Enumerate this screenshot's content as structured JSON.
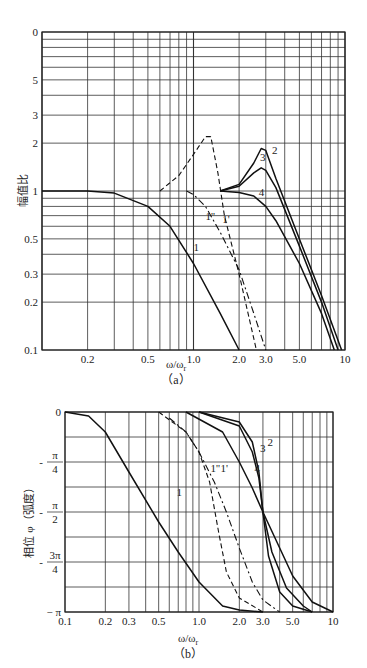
{
  "chart_data": [
    {
      "id": "a",
      "type": "line",
      "caption": "(a)",
      "title": "",
      "xlabel": "ω/ω_r",
      "ylabel": "幅值比",
      "xscale": "log",
      "yscale": "log",
      "xlim": [
        0.1,
        10
      ],
      "ylim": [
        0.1,
        10
      ],
      "x_ticks": [
        "0.2",
        "0.5",
        "1.0",
        "2.0",
        "3.0",
        "5.0",
        "10"
      ],
      "y_ticks": [
        "0",
        "5",
        "3",
        "2",
        "1",
        "0.5",
        "0.3",
        "0.2",
        "0.1"
      ],
      "grid": true,
      "series": [
        {
          "name": "1",
          "style": "solid",
          "x": [
            0.1,
            0.2,
            0.3,
            0.5,
            0.7,
            1.0,
            1.5,
            2.0
          ],
          "y": [
            1.0,
            1.0,
            0.97,
            0.8,
            0.6,
            0.35,
            0.17,
            0.1
          ]
        },
        {
          "name": "1'",
          "style": "dashed",
          "x": [
            0.6,
            0.8,
            1.0,
            1.2,
            1.3,
            1.45,
            1.6,
            2.0,
            2.6
          ],
          "y": [
            1.0,
            1.25,
            1.7,
            2.2,
            2.2,
            1.3,
            0.7,
            0.3,
            0.1
          ]
        },
        {
          "name": "1''",
          "style": "dash-dot",
          "x": [
            0.9,
            1.0,
            1.2,
            1.5,
            2.0,
            2.5,
            3.0
          ],
          "y": [
            1.0,
            0.95,
            0.8,
            0.55,
            0.32,
            0.17,
            0.1
          ]
        },
        {
          "name": "2",
          "style": "solid",
          "x": [
            1.5,
            2.0,
            2.5,
            2.8,
            3.0,
            3.5,
            5.0,
            7.0,
            9.5
          ],
          "y": [
            1.0,
            1.1,
            1.5,
            1.85,
            1.8,
            1.2,
            0.5,
            0.22,
            0.1
          ]
        },
        {
          "name": "3",
          "style": "solid",
          "x": [
            1.5,
            2.0,
            2.5,
            2.8,
            3.0,
            3.5,
            5.0,
            7.0,
            9.0
          ],
          "y": [
            1.0,
            1.07,
            1.3,
            1.4,
            1.35,
            1.05,
            0.45,
            0.2,
            0.1
          ]
        },
        {
          "name": "4",
          "style": "solid",
          "x": [
            1.5,
            2.0,
            2.5,
            3.0,
            3.5,
            5.0,
            7.0,
            8.5
          ],
          "y": [
            1.0,
            0.98,
            0.93,
            0.8,
            0.65,
            0.35,
            0.17,
            0.1
          ]
        }
      ]
    },
    {
      "id": "b",
      "type": "line",
      "caption": "(b)",
      "title": "",
      "xlabel": "ω/ω_r",
      "ylabel": "相位 φ (弧度)",
      "xscale": "log",
      "yscale": "linear",
      "xlim": [
        0.1,
        10
      ],
      "ylim": [
        -3.1416,
        0
      ],
      "x_ticks": [
        "0.1",
        "0.2",
        "0.3",
        "0.5",
        "1.0",
        "2.0",
        "3.0",
        "5.0",
        "10"
      ],
      "y_ticks": [
        "0",
        "-π/4",
        "-π/2",
        "-3π/4",
        "-π"
      ],
      "grid": true,
      "series": [
        {
          "name": "1",
          "style": "solid",
          "x": [
            0.1,
            0.15,
            0.2,
            0.3,
            0.5,
            0.7,
            1.0,
            1.5,
            2.0,
            3.0
          ],
          "y_frac_pi": [
            0,
            -0.02,
            -0.1,
            -0.3,
            -0.55,
            -0.7,
            -0.85,
            -0.97,
            -0.99,
            -1.0
          ]
        },
        {
          "name": "1'",
          "style": "dashed",
          "x": [
            0.5,
            0.8,
            1.0,
            1.2,
            1.4,
            1.6,
            2.0,
            3.0
          ],
          "y_frac_pi": [
            0,
            -0.1,
            -0.2,
            -0.35,
            -0.6,
            -0.8,
            -0.93,
            -1.0
          ]
        },
        {
          "name": "1''",
          "style": "dash-dot",
          "x": [
            0.6,
            0.8,
            1.0,
            1.3,
            1.6,
            2.0,
            2.5,
            3.0,
            4.0
          ],
          "y_frac_pi": [
            -0.03,
            -0.1,
            -0.2,
            -0.35,
            -0.5,
            -0.68,
            -0.85,
            -0.94,
            -1.0
          ]
        },
        {
          "name": "2",
          "style": "solid",
          "x": [
            1.0,
            2.0,
            2.5,
            2.8,
            3.0,
            3.3,
            4.0,
            5.0,
            7.0
          ],
          "y_frac_pi": [
            0,
            -0.05,
            -0.15,
            -0.3,
            -0.5,
            -0.72,
            -0.9,
            -0.97,
            -1.0
          ]
        },
        {
          "name": "3",
          "style": "solid",
          "x": [
            1.0,
            2.0,
            2.5,
            2.8,
            3.0,
            3.5,
            4.5,
            6.0,
            7.0
          ],
          "y_frac_pi": [
            0,
            -0.07,
            -0.2,
            -0.33,
            -0.5,
            -0.7,
            -0.88,
            -0.97,
            -1.0
          ]
        },
        {
          "name": "4",
          "style": "solid",
          "x": [
            0.8,
            1.5,
            2.0,
            2.5,
            3.0,
            4.0,
            5.0,
            7.0,
            10.0
          ],
          "y_frac_pi": [
            0,
            -0.1,
            -0.25,
            -0.38,
            -0.5,
            -0.68,
            -0.82,
            -0.95,
            -1.0
          ]
        }
      ]
    }
  ],
  "labels": {
    "a_caption": "（a）",
    "b_caption": "（b）",
    "a_xlabel": "ω/ω",
    "b_xlabel": "ω/ω",
    "x_sub": "r",
    "a_ylabel": "幅值比",
    "b_ylabel": "相位 φ（弧度）"
  }
}
